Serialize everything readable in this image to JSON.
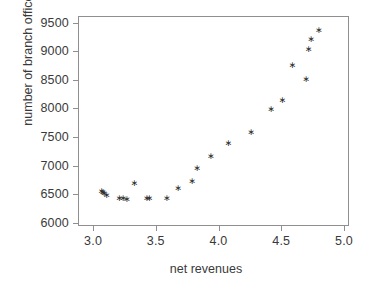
{
  "chart_data": {
    "type": "scatter",
    "title": "",
    "xlabel": "net revenues",
    "ylabel": "number of branch offices",
    "xlim": [
      2.88,
      5.04
    ],
    "ylim": [
      5940,
      9620
    ],
    "xticks": [
      "3.0",
      "3.5",
      "4.0",
      "4.5",
      "5.0"
    ],
    "xtick_values": [
      3.0,
      3.5,
      4.0,
      4.5,
      5.0
    ],
    "yticks": [
      "6000",
      "6500",
      "7000",
      "7500",
      "8000",
      "8500",
      "9000",
      "9500"
    ],
    "ytick_values": [
      6000,
      6500,
      7000,
      7500,
      8000,
      8500,
      9000,
      9500
    ],
    "grid": false,
    "legend": false,
    "marker": "asterisk",
    "marker_color": "#2b2b2b",
    "x": [
      3.06,
      3.07,
      3.08,
      3.1,
      3.2,
      3.23,
      3.26,
      3.32,
      3.42,
      3.44,
      3.58,
      3.67,
      3.78,
      3.82,
      3.93,
      4.07,
      4.25,
      4.41,
      4.5,
      4.58,
      4.69,
      4.71,
      4.79
    ],
    "y": [
      6570,
      6545,
      6520,
      6490,
      6435,
      6440,
      6420,
      6705,
      6435,
      6440,
      6445,
      6610,
      6740,
      6960,
      7180,
      7395,
      7600,
      7995,
      8160,
      8770,
      8520,
      9050,
      9225
    ],
    "points": [
      {
        "x": 3.06,
        "y": 6570
      },
      {
        "x": 3.07,
        "y": 6545
      },
      {
        "x": 3.08,
        "y": 6520
      },
      {
        "x": 3.1,
        "y": 6490
      },
      {
        "x": 3.2,
        "y": 6435
      },
      {
        "x": 3.23,
        "y": 6440
      },
      {
        "x": 3.26,
        "y": 6420
      },
      {
        "x": 3.32,
        "y": 6705
      },
      {
        "x": 3.42,
        "y": 6435
      },
      {
        "x": 3.44,
        "y": 6440
      },
      {
        "x": 3.58,
        "y": 6445
      },
      {
        "x": 3.67,
        "y": 6610
      },
      {
        "x": 3.78,
        "y": 6740
      },
      {
        "x": 3.82,
        "y": 6960
      },
      {
        "x": 3.93,
        "y": 7180
      },
      {
        "x": 4.07,
        "y": 7395
      },
      {
        "x": 4.25,
        "y": 7600
      },
      {
        "x": 4.41,
        "y": 7995
      },
      {
        "x": 4.5,
        "y": 8160
      },
      {
        "x": 4.58,
        "y": 8770
      },
      {
        "x": 4.69,
        "y": 8520
      },
      {
        "x": 4.71,
        "y": 9050
      },
      {
        "x": 4.73,
        "y": 9225
      },
      {
        "x": 4.79,
        "y": 9380
      }
    ]
  }
}
